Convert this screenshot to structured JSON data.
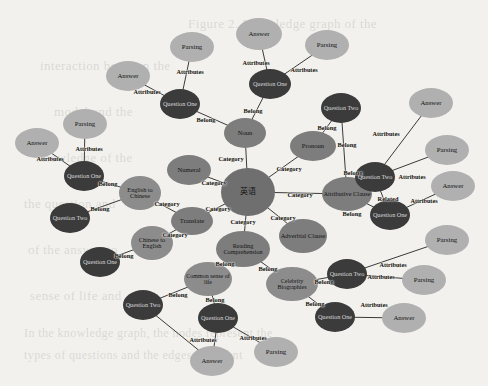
{
  "diagram": {
    "type": "node-link-graph",
    "background_color": "#f2f1ed",
    "palette": {
      "center": "#6f6f6f",
      "category": "#7d7d7d",
      "subcategory": "#8c8c8c",
      "question": "#3b3b3b",
      "attribute": "#b0b0b0"
    },
    "background_text": [
      {
        "text": "Figure 2. Knowledge graph of the",
        "x": 188,
        "y": 16,
        "size": 13
      },
      {
        "text": "interaction between the",
        "x": 40,
        "y": 58,
        "size": 13
      },
      {
        "text": "model and the",
        "x": 54,
        "y": 104,
        "size": 13
      },
      {
        "text": "knowledge of the",
        "x": 36,
        "y": 150,
        "size": 13
      },
      {
        "text": "the question and",
        "x": 24,
        "y": 196,
        "size": 13
      },
      {
        "text": "of the answer to",
        "x": 28,
        "y": 242,
        "size": 13
      },
      {
        "text": "sense of life and",
        "x": 30,
        "y": 288,
        "size": 13
      },
      {
        "text": "In the knowledge graph, the nodes represent the",
        "x": 24,
        "y": 326,
        "size": 12
      },
      {
        "text": "types of questions and the edges represent",
        "x": 24,
        "y": 348,
        "size": 12
      }
    ],
    "nodes": [
      {
        "id": "center",
        "label": "英语",
        "x": 248,
        "y": 192,
        "rx": 27,
        "ry": 24,
        "fill": "#6f6f6f",
        "fs": 8,
        "color": "#141414"
      },
      {
        "id": "noun",
        "label": "Noun",
        "x": 245,
        "y": 133,
        "rx": 21,
        "ry": 15,
        "fill": "#7d7d7d",
        "fs": 6.6,
        "color": "#141414"
      },
      {
        "id": "pronoun",
        "label": "Pronoun",
        "x": 313,
        "y": 146,
        "rx": 23,
        "ry": 15,
        "fill": "#7d7d7d",
        "fs": 6.6,
        "color": "#141414"
      },
      {
        "id": "numeral",
        "label": "Numeral",
        "x": 189,
        "y": 170,
        "rx": 22,
        "ry": 15,
        "fill": "#7d7d7d",
        "fs": 6.6,
        "color": "#141414"
      },
      {
        "id": "attributive",
        "label": "Attributive Clause",
        "x": 347,
        "y": 194,
        "rx": 25,
        "ry": 17,
        "fill": "#7d7d7d",
        "fs": 6.4,
        "color": "#141414"
      },
      {
        "id": "adverbial",
        "label": "Adverbial Clause",
        "x": 303,
        "y": 236,
        "rx": 24,
        "ry": 17,
        "fill": "#7d7d7d",
        "fs": 6.4,
        "color": "#141414"
      },
      {
        "id": "reading",
        "label": "Reading Comprehension",
        "x": 243,
        "y": 249,
        "rx": 27,
        "ry": 18,
        "fill": "#7d7d7d",
        "fs": 6.2,
        "color": "#141414"
      },
      {
        "id": "translate",
        "label": "Translate",
        "x": 192,
        "y": 221,
        "rx": 21,
        "ry": 14,
        "fill": "#7d7d7d",
        "fs": 6.6,
        "color": "#141414"
      },
      {
        "id": "eng2chi",
        "label": "English to Chinese",
        "x": 140,
        "y": 193,
        "rx": 21,
        "ry": 17,
        "fill": "#8c8c8c",
        "fs": 6.2,
        "color": "#141414"
      },
      {
        "id": "chi2eng",
        "label": "Chinese to English",
        "x": 152,
        "y": 243,
        "rx": 21,
        "ry": 17,
        "fill": "#8c8c8c",
        "fs": 6.2,
        "color": "#141414"
      },
      {
        "id": "commons",
        "label": "Common sense of life",
        "x": 208,
        "y": 279,
        "rx": 24,
        "ry": 17,
        "fill": "#8c8c8c",
        "fs": 6.0,
        "color": "#141414"
      },
      {
        "id": "celeb",
        "label": "Celebrity Biographies",
        "x": 292,
        "y": 284,
        "rx": 26,
        "ry": 17,
        "fill": "#8c8c8c",
        "fs": 6.0,
        "color": "#141414"
      },
      {
        "id": "q_tl",
        "label": "Question One",
        "x": 84,
        "y": 176,
        "rx": 20,
        "ry": 15,
        "fill": "#3b3b3b",
        "fs": 6.2,
        "color": "#d8d8d8"
      },
      {
        "id": "q_l1",
        "label": "Question Two",
        "x": 70,
        "y": 218,
        "rx": 20,
        "ry": 15,
        "fill": "#3b3b3b",
        "fs": 6.2,
        "color": "#d8d8d8"
      },
      {
        "id": "q_l2",
        "label": "Question One",
        "x": 100,
        "y": 262,
        "rx": 20,
        "ry": 15,
        "fill": "#3b3b3b",
        "fs": 6.2,
        "color": "#d8d8d8"
      },
      {
        "id": "q_bl",
        "label": "Question Two",
        "x": 143,
        "y": 305,
        "rx": 20,
        "ry": 15,
        "fill": "#3b3b3b",
        "fs": 6.2,
        "color": "#d8d8d8"
      },
      {
        "id": "q_bc",
        "label": "Question One",
        "x": 218,
        "y": 318,
        "rx": 20,
        "ry": 15,
        "fill": "#3b3b3b",
        "fs": 6.2,
        "color": "#d8d8d8"
      },
      {
        "id": "q_tc1",
        "label": "Question One",
        "x": 180,
        "y": 104,
        "rx": 20,
        "ry": 15,
        "fill": "#3b3b3b",
        "fs": 6.2,
        "color": "#d8d8d8"
      },
      {
        "id": "q_tc2",
        "label": "Question One",
        "x": 270,
        "y": 84,
        "rx": 21,
        "ry": 15,
        "fill": "#3b3b3b",
        "fs": 6.2,
        "color": "#d8d8d8"
      },
      {
        "id": "q_tr",
        "label": "Question Two",
        "x": 341,
        "y": 108,
        "rx": 20,
        "ry": 15,
        "fill": "#3b3b3b",
        "fs": 6.2,
        "color": "#d8d8d8"
      },
      {
        "id": "q_r1",
        "label": "Question Two",
        "x": 375,
        "y": 177,
        "rx": 20,
        "ry": 15,
        "fill": "#3b3b3b",
        "fs": 6.2,
        "color": "#d8d8d8"
      },
      {
        "id": "q_r2",
        "label": "Question One",
        "x": 390,
        "y": 215,
        "rx": 20,
        "ry": 15,
        "fill": "#3b3b3b",
        "fs": 6.2,
        "color": "#d8d8d8"
      },
      {
        "id": "q_br",
        "label": "Question Two",
        "x": 347,
        "y": 274,
        "rx": 20,
        "ry": 15,
        "fill": "#3b3b3b",
        "fs": 6.2,
        "color": "#d8d8d8"
      },
      {
        "id": "q_br2",
        "label": "Question One",
        "x": 335,
        "y": 317,
        "rx": 20,
        "ry": 15,
        "fill": "#3b3b3b",
        "fs": 6.2,
        "color": "#d8d8d8"
      },
      {
        "id": "a_tl",
        "label": "Answer",
        "x": 37,
        "y": 143,
        "rx": 22,
        "ry": 15,
        "fill": "#b0b0b0",
        "fs": 6.8,
        "color": "#141414"
      },
      {
        "id": "p_tl",
        "label": "Parsing",
        "x": 85,
        "y": 124,
        "rx": 22,
        "ry": 15,
        "fill": "#b0b0b0",
        "fs": 6.8,
        "color": "#141414"
      },
      {
        "id": "a_tc",
        "label": "Answer",
        "x": 128,
        "y": 76,
        "rx": 22,
        "ry": 15,
        "fill": "#b0b0b0",
        "fs": 6.8,
        "color": "#141414"
      },
      {
        "id": "p_tc",
        "label": "Parsing",
        "x": 192,
        "y": 47,
        "rx": 22,
        "ry": 15,
        "fill": "#b0b0b0",
        "fs": 6.8,
        "color": "#141414"
      },
      {
        "id": "a_top",
        "label": "Answer",
        "x": 259,
        "y": 34,
        "rx": 23,
        "ry": 16,
        "fill": "#b0b0b0",
        "fs": 6.8,
        "color": "#141414"
      },
      {
        "id": "p_top",
        "label": "Parsing",
        "x": 327,
        "y": 45,
        "rx": 22,
        "ry": 15,
        "fill": "#b0b0b0",
        "fs": 6.8,
        "color": "#141414"
      },
      {
        "id": "a_tr",
        "label": "Answer",
        "x": 431,
        "y": 103,
        "rx": 22,
        "ry": 15,
        "fill": "#b0b0b0",
        "fs": 6.8,
        "color": "#141414"
      },
      {
        "id": "p_r1",
        "label": "Parsing",
        "x": 447,
        "y": 150,
        "rx": 22,
        "ry": 15,
        "fill": "#b0b0b0",
        "fs": 6.8,
        "color": "#141414"
      },
      {
        "id": "a_r2",
        "label": "Answer",
        "x": 453,
        "y": 186,
        "rx": 22,
        "ry": 15,
        "fill": "#b0b0b0",
        "fs": 6.8,
        "color": "#141414"
      },
      {
        "id": "p_r2",
        "label": "Parsing",
        "x": 447,
        "y": 240,
        "rx": 22,
        "ry": 15,
        "fill": "#b0b0b0",
        "fs": 6.8,
        "color": "#141414"
      },
      {
        "id": "p_br",
        "label": "Parsing",
        "x": 424,
        "y": 280,
        "rx": 22,
        "ry": 15,
        "fill": "#b0b0b0",
        "fs": 6.8,
        "color": "#141414"
      },
      {
        "id": "a_br",
        "label": "Answer",
        "x": 404,
        "y": 318,
        "rx": 22,
        "ry": 15,
        "fill": "#b0b0b0",
        "fs": 6.8,
        "color": "#141414"
      },
      {
        "id": "a_bc",
        "label": "Answer",
        "x": 212,
        "y": 361,
        "rx": 22,
        "ry": 15,
        "fill": "#b0b0b0",
        "fs": 6.8,
        "color": "#141414"
      },
      {
        "id": "p_bc",
        "label": "Parsing",
        "x": 276,
        "y": 352,
        "rx": 22,
        "ry": 15,
        "fill": "#b0b0b0",
        "fs": 6.8,
        "color": "#141414"
      }
    ],
    "edges": [
      {
        "from": "center",
        "to": "noun",
        "label": "Category",
        "lx": 231,
        "ly": 158
      },
      {
        "from": "center",
        "to": "pronoun",
        "label": "Category",
        "lx": 289,
        "ly": 168
      },
      {
        "from": "center",
        "to": "numeral",
        "label": "Category",
        "lx": 214,
        "ly": 182
      },
      {
        "from": "center",
        "to": "attributive",
        "label": "Category",
        "lx": 300,
        "ly": 194
      },
      {
        "from": "center",
        "to": "adverbial",
        "label": "Category",
        "lx": 283,
        "ly": 217
      },
      {
        "from": "center",
        "to": "reading",
        "label": "Category",
        "lx": 243,
        "ly": 221
      },
      {
        "from": "center",
        "to": "translate",
        "label": "Category",
        "lx": 218,
        "ly": 208
      },
      {
        "from": "translate",
        "to": "eng2chi",
        "label": "Category",
        "lx": 167,
        "ly": 203
      },
      {
        "from": "translate",
        "to": "chi2eng",
        "label": "Category",
        "lx": 175,
        "ly": 234
      },
      {
        "from": "reading",
        "to": "commons",
        "label": "Belong",
        "lx": 225,
        "ly": 263
      },
      {
        "from": "reading",
        "to": "celeb",
        "label": "Belong",
        "lx": 268,
        "ly": 268
      },
      {
        "from": "noun",
        "to": "q_tc1",
        "label": "Belong",
        "lx": 206,
        "ly": 119
      },
      {
        "from": "noun",
        "to": "q_tc2",
        "label": "Belong",
        "lx": 253,
        "ly": 110
      },
      {
        "from": "pronoun",
        "to": "q_tr",
        "label": "Belong",
        "lx": 327,
        "ly": 127
      },
      {
        "from": "attributive",
        "to": "q_tr",
        "label": "Belong",
        "lx": 347,
        "ly": 144
      },
      {
        "from": "attributive",
        "to": "q_r1",
        "label": "Belong",
        "lx": 353,
        "ly": 172
      },
      {
        "from": "attributive",
        "to": "q_r2",
        "label": "Belong",
        "lx": 352,
        "ly": 213
      },
      {
        "from": "q_r1",
        "to": "q_r2",
        "label": "Related",
        "lx": 388,
        "ly": 198
      },
      {
        "from": "eng2chi",
        "to": "q_tl",
        "label": "Belong",
        "lx": 108,
        "ly": 183
      },
      {
        "from": "eng2chi",
        "to": "q_l1",
        "label": "Belong",
        "lx": 100,
        "ly": 208
      },
      {
        "from": "chi2eng",
        "to": "q_l2",
        "label": "Belong",
        "lx": 124,
        "ly": 255
      },
      {
        "from": "commons",
        "to": "q_bl",
        "label": "Belong",
        "lx": 178,
        "ly": 294
      },
      {
        "from": "commons",
        "to": "q_bc",
        "label": "Belong",
        "lx": 215,
        "ly": 299
      },
      {
        "from": "celeb",
        "to": "q_br",
        "label": "Belong",
        "lx": 324,
        "ly": 281
      },
      {
        "from": "celeb",
        "to": "q_br2",
        "label": "Belong",
        "lx": 315,
        "ly": 303
      },
      {
        "from": "q_tl",
        "to": "a_tl",
        "label": "Attributes",
        "lx": 50,
        "ly": 158
      },
      {
        "from": "q_tl",
        "to": "p_tl",
        "label": "Attributes",
        "lx": 89,
        "ly": 148
      },
      {
        "from": "q_tc1",
        "to": "a_tc",
        "label": "Attributes",
        "lx": 147,
        "ly": 91
      },
      {
        "from": "q_tc1",
        "to": "p_tc",
        "label": "Attributes",
        "lx": 190,
        "ly": 71
      },
      {
        "from": "q_tc2",
        "to": "a_top",
        "label": "Attributes",
        "lx": 256,
        "ly": 62
      },
      {
        "from": "q_tc2",
        "to": "p_top",
        "label": "Attributes",
        "lx": 304,
        "ly": 69
      },
      {
        "from": "q_r1",
        "to": "a_tr",
        "label": "Attributes",
        "lx": 386,
        "ly": 133
      },
      {
        "from": "q_r1",
        "to": "p_r1",
        "label": "Attributes",
        "lx": 412,
        "ly": 176
      },
      {
        "from": "q_r2",
        "to": "a_r2",
        "label": "Attributes",
        "lx": 424,
        "ly": 200
      },
      {
        "from": "q_br",
        "to": "p_r2",
        "label": "Attributes",
        "lx": 393,
        "ly": 264
      },
      {
        "from": "q_br",
        "to": "p_br",
        "label": "Attributes",
        "lx": 381,
        "ly": 276
      },
      {
        "from": "q_br2",
        "to": "a_br",
        "label": "Attributes",
        "lx": 374,
        "ly": 304
      },
      {
        "from": "q_bc",
        "to": "a_bc",
        "label": "Attributes",
        "lx": 203,
        "ly": 339
      },
      {
        "from": "q_bc",
        "to": "p_bc",
        "label": "Attributes",
        "lx": 253,
        "ly": 337
      },
      {
        "from": "q_bl",
        "to": "a_bc",
        "label": "",
        "lx": 0,
        "ly": 0
      }
    ]
  }
}
